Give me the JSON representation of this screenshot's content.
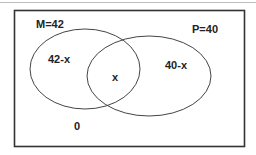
{
  "diagram": {
    "type": "venn",
    "universe": {
      "outside_label": "0"
    },
    "sets": [
      {
        "name": "M",
        "label": "M=42",
        "total": 42,
        "only_label": "42-x"
      },
      {
        "name": "P",
        "label": "P=40",
        "total": 40,
        "only_label": "40-x"
      }
    ],
    "intersection_label": "x",
    "colors": {
      "stroke": "#333333",
      "text": "#222222",
      "top_rule": "#bbbbbb",
      "background": "#ffffff"
    }
  }
}
